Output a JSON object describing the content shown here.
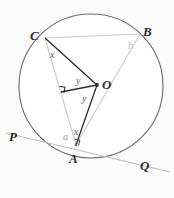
{
  "figure": {
    "width": 174,
    "height": 198,
    "background_color": "#fbfbfb"
  },
  "colors": {
    "circle_stroke": "#6b6b6b",
    "chord_stroke": "#c9c9c9",
    "radius_stroke": "#2b2b2b",
    "tangent_stroke": "#bdbdbd",
    "label_color": "#2b2b2b",
    "angle_color": "#5a5a5a",
    "faint_color": "#c2c2c2"
  },
  "geometry": {
    "circle": {
      "cx": 91,
      "cy": 86,
      "r": 72
    },
    "points": {
      "A": {
        "x": 76,
        "y": 145
      },
      "B": {
        "x": 140,
        "y": 34
      },
      "C": {
        "x": 45,
        "y": 38
      },
      "O": {
        "x": 97,
        "y": 85
      },
      "P": {
        "x": 14,
        "y": 136
      },
      "Q": {
        "x": 160,
        "y": 166
      },
      "M": {
        "x": 61,
        "y": 92
      }
    }
  },
  "point_labels": {
    "A": "A",
    "B": "B",
    "C": "C",
    "O": "O",
    "P": "P",
    "Q": "Q"
  },
  "angle_labels": {
    "at_C": "x",
    "at_A_tangent": "x",
    "at_A_alpha": "a",
    "at_O_upper": "y",
    "at_O_lower": "y",
    "at_B": "b"
  },
  "markers": {
    "right_angle_at_A": "right-angle-marker",
    "right_angle_at_M": "right-angle-marker"
  },
  "segments": [
    {
      "name": "chord-CB",
      "from": "C",
      "to": "B",
      "style": "light"
    },
    {
      "name": "chord-CA",
      "from": "C",
      "to": "A",
      "style": "light"
    },
    {
      "name": "chord-AB",
      "from": "A",
      "to": "B",
      "style": "light"
    },
    {
      "name": "radius-OC",
      "from": "O",
      "to": "C",
      "style": "dark"
    },
    {
      "name": "radius-OA",
      "from": "O",
      "to": "A",
      "style": "dark"
    },
    {
      "name": "perpendicular-OM",
      "from": "O",
      "to": "M",
      "style": "dark"
    },
    {
      "name": "tangent-PQ",
      "from": "P",
      "to": "Q",
      "style": "tangent"
    }
  ]
}
